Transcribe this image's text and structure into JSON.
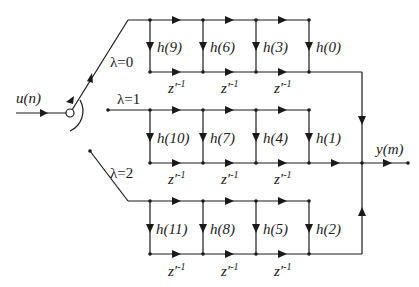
{
  "diagram": {
    "type": "polyphase-filter-signal-flow",
    "input_label": "u(n)",
    "output_label": "y(m)",
    "switch_positions": [
      {
        "label": "λ=0"
      },
      {
        "label": "λ=1"
      },
      {
        "label": "λ=2"
      }
    ],
    "branches": [
      {
        "name": "branch-0",
        "coefficients": [
          "h(9)",
          "h(6)",
          "h(3)",
          "h(0)"
        ],
        "delays": [
          "z′-1",
          "z′-1",
          "z′-1"
        ]
      },
      {
        "name": "branch-1",
        "coefficients": [
          "h(10)",
          "h(7)",
          "h(4)",
          "h(1)"
        ],
        "delays": [
          "z′-1",
          "z′-1",
          "z′-1"
        ]
      },
      {
        "name": "branch-2",
        "coefficients": [
          "h(11)",
          "h(8)",
          "h(5)",
          "h(2)"
        ],
        "delays": [
          "z′-1",
          "z′-1",
          "z′-1"
        ]
      }
    ],
    "delay_label": "z′",
    "delay_exp": "-1",
    "colors": {
      "line": "#1a1a1a",
      "background": "#ffffff"
    }
  }
}
